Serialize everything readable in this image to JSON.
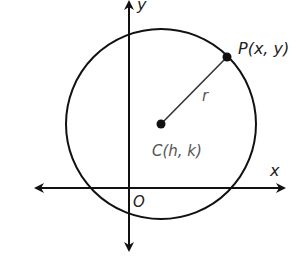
{
  "diagram": {
    "type": "circle-on-coordinate-plane",
    "axes": {
      "x_label": "x",
      "y_label": "y",
      "origin_label": "O"
    },
    "center": {
      "label": "C(h, k)"
    },
    "point": {
      "label": "P(x, y)"
    },
    "radius": {
      "label": "r"
    },
    "colors": {
      "stroke": "#111111",
      "center_label": "#555555",
      "background": "#ffffff"
    }
  }
}
